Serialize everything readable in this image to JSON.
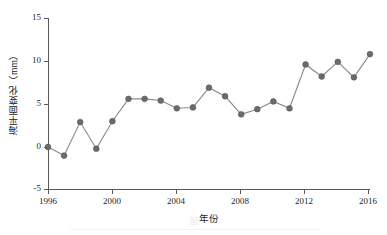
{
  "chart_data": {
    "type": "line",
    "title": "",
    "xlabel": "年份",
    "ylabel": "海平面变化（mm）",
    "xlim": [
      1996,
      2016
    ],
    "ylim": [
      -5,
      15
    ],
    "xticks": [
      1996,
      2000,
      2004,
      2008,
      2012,
      2016
    ],
    "yticks": [
      -5,
      0,
      5,
      10,
      15
    ],
    "grid": false,
    "legend": null,
    "marker": "circle",
    "marker_color": "#6b6b6b",
    "line_color": "#8a8a8a",
    "x": [
      1996,
      1997,
      1998,
      1999,
      2000,
      2001,
      2002,
      2003,
      2004,
      2005,
      2006,
      2007,
      2008,
      2009,
      2010,
      2011,
      2012,
      2013,
      2014,
      2015,
      2016
    ],
    "values": [
      0.0,
      -1.0,
      2.9,
      -0.2,
      3.0,
      5.6,
      5.6,
      5.4,
      4.5,
      4.6,
      6.9,
      5.9,
      3.8,
      4.4,
      5.3,
      4.5,
      9.6,
      8.2,
      9.9,
      8.1,
      10.8
    ],
    "series": [
      {
        "name": "海平面变化",
        "values": [
          0.0,
          -1.0,
          2.9,
          -0.2,
          3.0,
          5.6,
          5.6,
          5.4,
          4.5,
          4.6,
          6.9,
          5.9,
          3.8,
          4.4,
          5.3,
          4.5,
          9.6,
          8.2,
          9.9,
          8.1,
          10.8
        ]
      }
    ]
  },
  "axes": {
    "y_title": "海平面变化（mm）",
    "x_title": "年份",
    "y_tick_labels": [
      "15",
      "10",
      "5",
      "0",
      "-5"
    ],
    "x_tick_labels": [
      "1996",
      "2000",
      "2004",
      "2008",
      "2012",
      "2016"
    ]
  },
  "caption": {
    "text": "图"
  }
}
